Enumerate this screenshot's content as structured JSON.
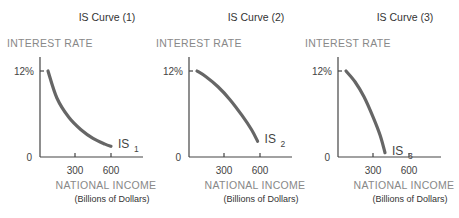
{
  "chart_data": [
    {
      "type": "line",
      "title": "IS Curve (1)",
      "ylabel": "INTEREST RATE",
      "xlabel": "NATIONAL INCOME",
      "xlabel_sub": "(Billions of Dollars)",
      "xticks": [
        "300",
        "600"
      ],
      "yticks": [
        "12%"
      ],
      "origin_label": "0",
      "xlim": [
        0,
        900
      ],
      "ylim": [
        0,
        15
      ],
      "grid": false,
      "series": [
        {
          "name": "IS",
          "subscript": "1",
          "shape": "convex",
          "x": [
            75,
            150,
            250,
            350,
            450,
            550,
            600
          ],
          "y": [
            12,
            8.2,
            5.5,
            3.8,
            2.6,
            1.8,
            1.5
          ]
        }
      ]
    },
    {
      "type": "line",
      "title": "IS Curve (2)",
      "ylabel": "INTEREST RATE",
      "xlabel": "NATIONAL INCOME",
      "xlabel_sub": "(Billions of Dollars)",
      "xticks": [
        "300",
        "600"
      ],
      "yticks": [
        "12%"
      ],
      "origin_label": "0",
      "xlim": [
        0,
        900
      ],
      "ylim": [
        0,
        15
      ],
      "grid": false,
      "series": [
        {
          "name": "IS",
          "subscript": "2",
          "shape": "concave",
          "x": [
            75,
            150,
            250,
            350,
            450,
            530,
            580
          ],
          "y": [
            12,
            11.2,
            9.8,
            8.0,
            5.8,
            3.8,
            2.2
          ]
        }
      ]
    },
    {
      "type": "line",
      "title": "IS Curve (3)",
      "ylabel": "INTEREST RATE",
      "xlabel": "NATIONAL INCOME",
      "xlabel_sub": "(Billions of Dollars)",
      "xticks": [
        "300",
        "600"
      ],
      "yticks": [
        "12%"
      ],
      "origin_label": "0",
      "xlim": [
        0,
        900
      ],
      "ylim": [
        0,
        15
      ],
      "grid": false,
      "series": [
        {
          "name": "IS",
          "subscript": "3",
          "shape": "concave",
          "x": [
            75,
            150,
            225,
            300,
            360,
            400
          ],
          "y": [
            12,
            10.5,
            8.4,
            5.6,
            3.0,
            0.6
          ]
        }
      ]
    }
  ]
}
